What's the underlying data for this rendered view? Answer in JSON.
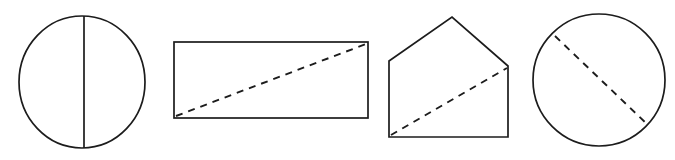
{
  "sheet": {
    "width": 675,
    "height": 160,
    "background_color": "#ffffff",
    "stroke_color": "#1c1c1c",
    "description": "Row of four geometry figures, each divided by an internal line"
  },
  "figures": [
    {
      "index": 1,
      "name": "circle-with-vertical-diameter",
      "shape_type": "circle",
      "label": "Circle divided by a vertical diameter",
      "outline": {
        "cx": 82,
        "cy": 82,
        "rx": 63,
        "ry": 66
      },
      "divider": {
        "style": "solid",
        "kind": "diameter",
        "x1": 84,
        "y1": 16,
        "x2": 84,
        "y2": 148
      }
    },
    {
      "index": 2,
      "name": "rectangle-with-dashed-diagonal",
      "shape_type": "rectangle",
      "label": "Rectangle divided by a dashed diagonal",
      "outline": {
        "x": 174,
        "y": 42,
        "width": 194,
        "height": 76
      },
      "divider": {
        "style": "dashed",
        "kind": "diagonal",
        "x1": 176,
        "y1": 116,
        "x2": 366,
        "y2": 44,
        "dash_pattern": "7 6"
      }
    },
    {
      "index": 3,
      "name": "pentagon-with-dashed-diagonal",
      "shape_type": "pentagon",
      "label": "House-shaped pentagon divided by a dashed diagonal",
      "outline": {
        "points": "389,137 389,61 452,17 508,66 508,137"
      },
      "divider": {
        "style": "dashed",
        "kind": "diagonal",
        "x1": 391,
        "y1": 135,
        "x2": 507,
        "y2": 68,
        "dash_pattern": "7 6"
      }
    },
    {
      "index": 4,
      "name": "circle-with-dashed-chord",
      "shape_type": "circle",
      "label": "Circle divided by a dashed chord",
      "outline": {
        "cx": 599,
        "cy": 80,
        "rx": 66,
        "ry": 66
      },
      "divider": {
        "style": "dashed",
        "kind": "chord",
        "x1": 555,
        "y1": 36,
        "x2": 648,
        "y2": 125,
        "dash_pattern": "7 6"
      }
    }
  ]
}
